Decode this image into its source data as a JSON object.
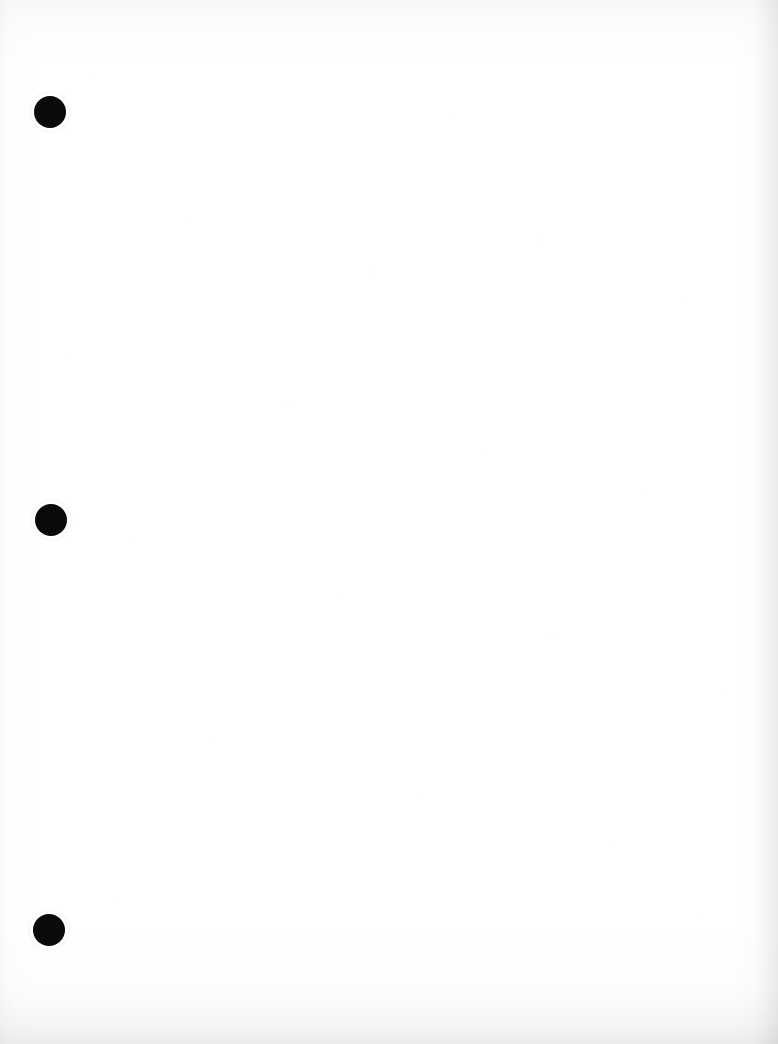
{
  "document": {
    "page_type": "scanned-blank-page",
    "orientation": "portrait",
    "body_text": "",
    "page_background_color": "#ffffff",
    "paper_tone_color": "#fdfdfd"
  },
  "binder_holes": {
    "name": "three-hole-punch",
    "count": 3,
    "color": "#0a0a0a",
    "diameter_px": 32,
    "items": [
      {
        "id": "hole-top",
        "label": "",
        "center_x": 50,
        "center_y": 112
      },
      {
        "id": "hole-middle",
        "label": "",
        "center_x": 51,
        "center_y": 520
      },
      {
        "id": "hole-bottom",
        "label": "",
        "center_x": 49,
        "center_y": 930
      }
    ]
  },
  "scan_artifacts": {
    "bottom_edge_shadow": true,
    "right_edge_shadow": true,
    "grain_speckle": true
  },
  "accessibility": {
    "page_description": "Blank scanned document page with three binder punch holes along the left margin"
  }
}
